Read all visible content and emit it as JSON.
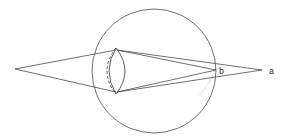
{
  "diagram": {
    "labels": {
      "point_b": "b",
      "point_a": "a"
    },
    "colors": {
      "stroke": "#4a4a4a",
      "background": "#ffffff"
    },
    "elements": {
      "eyeball": {
        "cx": 154,
        "cy": 71,
        "r": 62
      },
      "object_point": {
        "x": 15,
        "y": 69
      },
      "lens": {
        "top": [
          116,
          48
        ],
        "bottom": [
          116,
          94
        ]
      },
      "focus_b": {
        "x": 216,
        "y": 70
      },
      "focus_a": {
        "x": 262,
        "y": 70
      }
    }
  }
}
